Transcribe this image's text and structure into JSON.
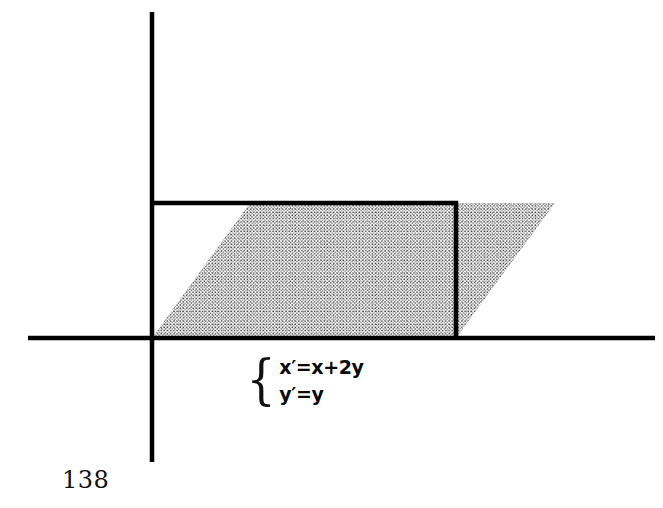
{
  "page": {
    "page_number": "138",
    "background_color": "#ffffff",
    "ink_color": "#000000"
  },
  "figure": {
    "name": "shear-transformation-diagram",
    "axes": {
      "x_axis": {
        "y": 338,
        "x_start": 28,
        "x_end": 655,
        "stroke_width": 4
      },
      "y_axis": {
        "x": 152,
        "y_start": 12,
        "y_end": 462,
        "stroke_width": 4
      },
      "origin": {
        "x": 152,
        "y": 338
      }
    },
    "outline": {
      "top_line": {
        "x1": 152,
        "y1": 203,
        "x2": 456,
        "y2": 203,
        "stroke_width": 4
      },
      "right_line": {
        "x1": 456,
        "y1": 203,
        "x2": 456,
        "y2": 338,
        "stroke_width": 4
      }
    },
    "shaded_region": {
      "label": "sheared-parallelogram",
      "vertices": [
        {
          "x": 152,
          "y": 338
        },
        {
          "x": 456,
          "y": 338
        },
        {
          "x": 555,
          "y": 203
        },
        {
          "x": 250,
          "y": 203
        }
      ],
      "fill": "stipple-dots",
      "dot_color": "#2b2b2b",
      "dot_spacing": 3.2
    }
  },
  "equations": {
    "brace_glyph": "{",
    "lines": [
      "x′=x+2y",
      "y′=y"
    ]
  }
}
